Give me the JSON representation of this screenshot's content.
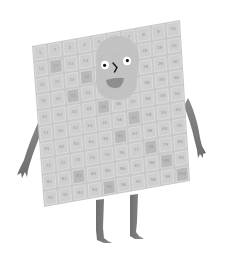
{
  "illustration": {
    "subject": "hundred square character",
    "grid": {
      "rows": 10,
      "cols": 10,
      "numbers_start": 1,
      "numbers_end": 100,
      "highlighted_cells": [
        12,
        24,
        33,
        45,
        57,
        66,
        78,
        83,
        89,
        95,
        100
      ]
    },
    "colors": {
      "board": "#c9c9c9",
      "cell": "#cfcfcf",
      "cell_dark": "#b9b9b9",
      "grid_line": "#e6e6e6",
      "face": "#bdbdbd",
      "limbs": "#7c7c7c",
      "eye_white": "#ffffff",
      "pupil": "#111111",
      "mouth": "#8e8e8e"
    }
  }
}
